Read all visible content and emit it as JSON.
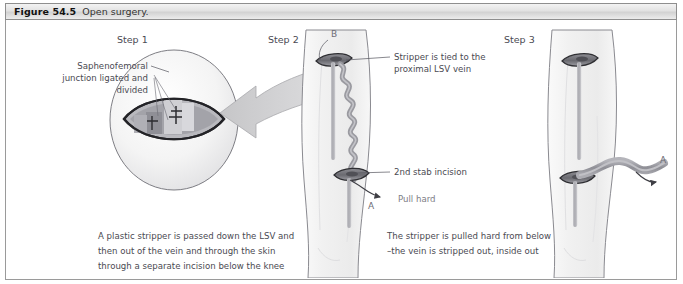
{
  "header": {
    "figure_number": "Figure 54.5",
    "caption": "Open surgery."
  },
  "steps": {
    "step1_label": "Step 1",
    "step2_label": "Step 2",
    "step3_label": "Step 3"
  },
  "annotations": {
    "saphenofemoral_line1": "Saphenofemoral",
    "saphenofemoral_line2": "junction ligated and",
    "saphenofemoral_line3": "divided",
    "stripper_tied_line1": "Stripper is tied  to the",
    "stripper_tied_line2": "proximal LSV vein",
    "stab_incision": "2nd stab incision",
    "pull_hard": "Pull hard",
    "marker_a_step2": "A",
    "marker_b_step2": "B",
    "marker_a_step3": "A"
  },
  "captions": {
    "left_line1": "A plastic stripper is passed  down the LSV and",
    "left_line2": "then out of  the vein and through the skin",
    "left_line3": "through a separate incision below the knee",
    "right_line1": "The stripper is pulled hard from below",
    "right_line2": "–the vein is stripped out, inside out"
  },
  "colors": {
    "skin_fill": "#f2f2f2",
    "skin_outline": "#8a8a90",
    "incision_dark": "#3a3a3e",
    "vein_gray": "#9a9aa0",
    "arrow_fill": "#d0d0d2",
    "text": "#4a4a52",
    "header_border": "#8e8e8e"
  }
}
